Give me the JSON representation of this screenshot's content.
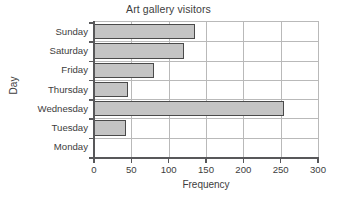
{
  "chart_data": {
    "type": "bar",
    "orientation": "horizontal",
    "title": "Art gallery visitors",
    "xlabel": "Frequency",
    "ylabel": "Day",
    "categories": [
      "Monday",
      "Tuesday",
      "Wednesday",
      "Thursday",
      "Friday",
      "Saturday",
      "Sunday"
    ],
    "values": [
      0,
      43,
      255,
      45,
      80,
      120,
      135
    ],
    "category_order_top_to_bottom": [
      "Sunday",
      "Saturday",
      "Friday",
      "Thursday",
      "Wednesday",
      "Tuesday",
      "Monday"
    ],
    "values_top_to_bottom": [
      135,
      120,
      80,
      45,
      255,
      43,
      0
    ],
    "xlim": [
      0,
      300
    ],
    "xticks": [
      0,
      50,
      100,
      150,
      200,
      250,
      300
    ],
    "xtick_labels": [
      "0",
      "50",
      "100",
      "150",
      "200",
      "250",
      "300"
    ],
    "grid": true,
    "legend": null,
    "bar_fill_color": "#c4c4c4",
    "bar_edge_color": "#4a4a4a",
    "axis_color": "#58585a",
    "grid_color": "#b9b9b9",
    "background_color": "#ffffff",
    "text_color": "#3d3d3d"
  }
}
